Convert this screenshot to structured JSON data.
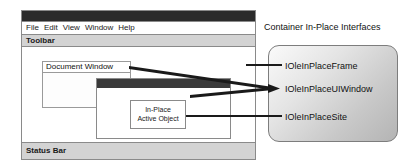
{
  "app_window": {
    "title_bar": {
      "text": ""
    },
    "menu": {
      "items": [
        {
          "label": "File"
        },
        {
          "label": "Edit"
        },
        {
          "label": "View"
        },
        {
          "label": "Window"
        },
        {
          "label": "Help"
        }
      ]
    },
    "toolbar": {
      "label": "Toolbar"
    },
    "status_bar": {
      "label": "Status Bar"
    },
    "document_window": {
      "title": "Document Window"
    },
    "inplace_window": {
      "title_bar_text": ""
    },
    "active_object": {
      "line1": "In-Place",
      "line2": "Active Object"
    }
  },
  "interface_panel": {
    "heading": "Container In-Place Interfaces",
    "interfaces": [
      {
        "name": "IOleInPlaceFrame"
      },
      {
        "name": "IOleInPlaceUIWindow"
      },
      {
        "name": "IOleInPlaceSite"
      }
    ]
  },
  "colors": {
    "title_bar": "#2b2b2b",
    "inplace_title_bar": "#3a3a3a",
    "toolbar_fill": "#d3d3d3",
    "status_fill": "#d3d3d3",
    "panel_border": "#7d7d7d",
    "connector": "#1a1a1a",
    "frame_border": "#8a8a8a"
  }
}
